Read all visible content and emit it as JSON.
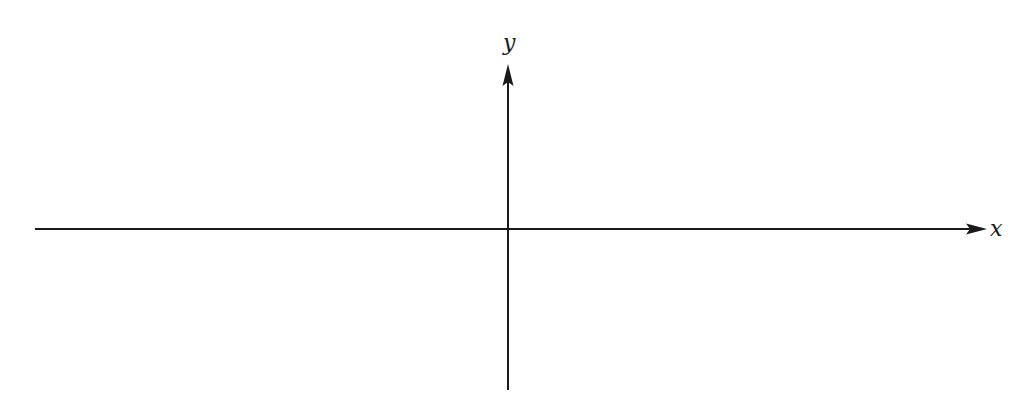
{
  "diagram": {
    "type": "cartesian-axes",
    "colors": {
      "background": "#ffffff",
      "axis": "#1a1a1a"
    },
    "x_axis": {
      "label": "x",
      "y": 229,
      "x_start": 35,
      "x_end": 985,
      "arrow": "right"
    },
    "y_axis": {
      "label": "y",
      "x": 508,
      "y_start": 390,
      "y_end": 65,
      "arrow": "up"
    },
    "origin": {
      "x": 508,
      "y": 229
    }
  }
}
